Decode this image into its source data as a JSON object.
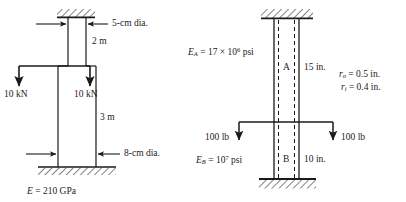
{
  "figure": {
    "background": "#ffffff",
    "line_color": "#1a1a1a"
  },
  "left_figure": {
    "name": "stepped-steel-column-metric",
    "top_dim_label": "5-cm dia.",
    "top_length_label": "2 m",
    "bottom_dim_label": "8-cm dia.",
    "bottom_length_label": "3 m",
    "load_left_label": "10 kN",
    "load_right_label": "10 kN",
    "modulus_symbol": "E",
    "modulus_eq": " = 210 GPa",
    "modulus_full": "E = 210 GPa",
    "supports": [
      "top-fixed-hatched",
      "bottom-fixed-hatched"
    ]
  },
  "right_figure": {
    "name": "hollow-tube-two-segment-imperial",
    "segment_a_label": "A",
    "segment_a_length": "15 in.",
    "segment_b_label": "B",
    "segment_b_length": "10 in.",
    "load_left_label": "100 lb",
    "load_right_label": "100 lb",
    "modulus_a_symbol": "E",
    "modulus_a_sub": "A",
    "modulus_a_value": " = 17 × 10",
    "modulus_a_exp": "6",
    "modulus_a_unit": " psi",
    "modulus_a_full": "E_A = 17 × 10^6 psi",
    "modulus_b_symbol": "E",
    "modulus_b_sub": "B",
    "modulus_b_value": " = 10",
    "modulus_b_exp": "7",
    "modulus_b_unit": " psi",
    "modulus_b_full": "E_B = 10^7 psi",
    "radius_outer_symbol": "r",
    "radius_outer_sub": "o",
    "radius_outer_value": " = 0.5 in.",
    "radius_inner_symbol": "r",
    "radius_inner_sub": "i",
    "radius_inner_value": " = 0.4 in.",
    "supports": [
      "top-fixed-hatched",
      "bottom-fixed-hatched"
    ]
  }
}
